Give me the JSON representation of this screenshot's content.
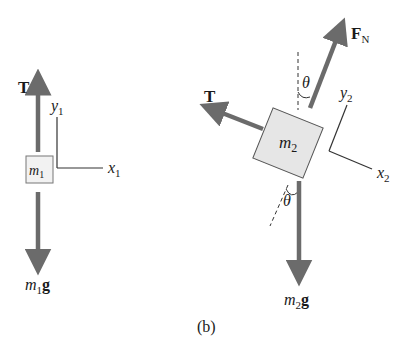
{
  "figure": {
    "caption": "(b)",
    "colors": {
      "force_arrow": "#6b6b6b",
      "axis_line": "#333333",
      "block_fill": "#e6e6e6",
      "block_stroke": "#555555",
      "text": "#1a1a1a"
    }
  },
  "left_diagram": {
    "mass_label": "m",
    "mass_sub": "1",
    "tension_label": "T",
    "weight_label_m": "m",
    "weight_label_sub": "1",
    "weight_label_g": "g",
    "y_axis_label": "y",
    "y_axis_sub": "1",
    "x_axis_label": "x",
    "x_axis_sub": "1"
  },
  "right_diagram": {
    "mass_label": "m",
    "mass_sub": "2",
    "tension_label": "T",
    "normal_label": "F",
    "normal_sub": "N",
    "weight_label_m": "m",
    "weight_label_sub": "2",
    "weight_label_g": "g",
    "y_axis_label": "y",
    "y_axis_sub": "2",
    "x_axis_label": "x",
    "x_axis_sub": "2",
    "angle_top": "θ",
    "angle_bottom": "θ",
    "incline_angle_deg": 22
  }
}
